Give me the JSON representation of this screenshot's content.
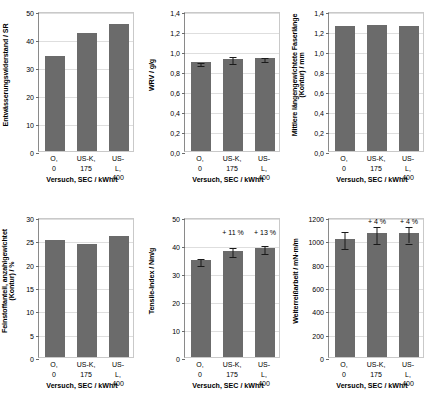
{
  "figure": {
    "categories": [
      "O,\n0",
      "US-K,\n175",
      "US-L,\n400"
    ],
    "xlabel": "Versuch, SEC / kWh/t",
    "bar_color": "#6b6b6b",
    "error_color": "#1a1a1a",
    "grid_color": "#dedede"
  },
  "chart_data": [
    {
      "type": "bar",
      "id": "dewatering-resistance",
      "title": "",
      "ylabel": "Entwässerungswiderstand / SR",
      "xlabel": "Versuch, SEC / kWh/t",
      "categories": [
        "O,\n0",
        "US-K,\n175",
        "US-L,\n400"
      ],
      "values": [
        34,
        42,
        45.5
      ],
      "errors": [
        0,
        0,
        0
      ],
      "ylim": [
        0,
        50
      ],
      "yticks": [
        0,
        10,
        20,
        30,
        40,
        50
      ],
      "ytick_labels": [
        "0",
        "10",
        "20",
        "30",
        "40",
        "50"
      ],
      "annotations": [],
      "grid": true,
      "legend": "none"
    },
    {
      "type": "bar",
      "id": "wrv",
      "title": "",
      "ylabel": "WRV / g/g",
      "xlabel": "Versuch, SEC / kWh/t",
      "categories": [
        "O,\n0",
        "US-K,\n175",
        "US-L,\n400"
      ],
      "values": [
        0.89,
        0.925,
        0.935
      ],
      "errors": [
        0.015,
        0.035,
        0.02
      ],
      "ylim": [
        0,
        1.4
      ],
      "yticks": [
        0,
        0.2,
        0.4,
        0.6,
        0.8,
        1.0,
        1.2,
        1.4
      ],
      "ytick_labels": [
        "0,0",
        "0,2",
        "0,4",
        "0,6",
        "0,8",
        "1,0",
        "1,2",
        "1,4"
      ],
      "annotations": [],
      "grid": true,
      "legend": "none"
    },
    {
      "type": "bar",
      "id": "fibre-length",
      "title": "",
      "ylabel": "Mittlere längengewichtete Faserlänge\n(Kontur) / mm",
      "xlabel": "Versuch, SEC / kWh/t",
      "categories": [
        "O,\n0",
        "US-K,\n175",
        "US-L,\n400"
      ],
      "values": [
        1.25,
        1.26,
        1.25
      ],
      "errors": [
        0,
        0,
        0
      ],
      "ylim": [
        0,
        1.4
      ],
      "yticks": [
        0,
        0.2,
        0.4,
        0.6,
        0.8,
        1.0,
        1.2,
        1.4
      ],
      "ytick_labels": [
        "0,0",
        "0,2",
        "0,4",
        "0,6",
        "0,8",
        "1,0",
        "1,2",
        "1,4"
      ],
      "annotations": [],
      "grid": true,
      "legend": "none"
    },
    {
      "type": "bar",
      "id": "fines-content",
      "title": "",
      "ylabel": "Feinstoffanteil, anzahlgewichtet\n(Kontur) / %",
      "xlabel": "Versuch, SEC / kWh/t",
      "categories": [
        "O,\n0",
        "US-K,\n175",
        "US-L,\n400"
      ],
      "values": [
        25.0,
        24.3,
        26.0
      ],
      "errors": [
        0,
        0,
        0
      ],
      "ylim": [
        0,
        30
      ],
      "yticks": [
        0,
        5,
        10,
        15,
        20,
        25,
        30
      ],
      "ytick_labels": [
        "0",
        "5",
        "10",
        "15",
        "20",
        "25",
        "30"
      ],
      "annotations": [],
      "grid": true,
      "legend": "none"
    },
    {
      "type": "bar",
      "id": "tensile-index",
      "title": "",
      "ylabel": "Tensile-Index / Nm/g",
      "xlabel": "Versuch, SEC / kWh/t",
      "categories": [
        "O,\n0",
        "US-K,\n175",
        "US-L,\n400"
      ],
      "values": [
        34.5,
        38.0,
        39.0
      ],
      "errors": [
        1.3,
        1.6,
        1.4
      ],
      "ylim": [
        0,
        50
      ],
      "yticks": [
        0,
        10,
        20,
        30,
        40,
        50
      ],
      "ytick_labels": [
        "0",
        "10",
        "20",
        "30",
        "40",
        "50"
      ],
      "annotations": [
        {
          "category_index": 1,
          "text": "+ 11 %",
          "y": 44.5
        },
        {
          "category_index": 2,
          "text": "+ 13 %",
          "y": 44.5
        }
      ],
      "grid": true,
      "legend": "none"
    },
    {
      "type": "bar",
      "id": "tear-work",
      "title": "",
      "ylabel": "Weiterreißarbeit / mN·m/m",
      "xlabel": "Versuch, SEC / kWh/t",
      "categories": [
        "O,\n0",
        "US-K,\n175",
        "US-L,\n400"
      ],
      "values": [
        1015,
        1060,
        1060
      ],
      "errors": [
        75,
        75,
        70
      ],
      "ylim": [
        0,
        1200
      ],
      "yticks": [
        0,
        200,
        400,
        600,
        800,
        1000,
        1200
      ],
      "ytick_labels": [
        "0",
        "200",
        "400",
        "600",
        "800",
        "1000",
        "1200"
      ],
      "annotations": [
        {
          "category_index": 1,
          "text": "+ 4 %",
          "y": 1165
        },
        {
          "category_index": 2,
          "text": "+ 4 %",
          "y": 1165
        }
      ],
      "grid": true,
      "legend": "none"
    }
  ]
}
